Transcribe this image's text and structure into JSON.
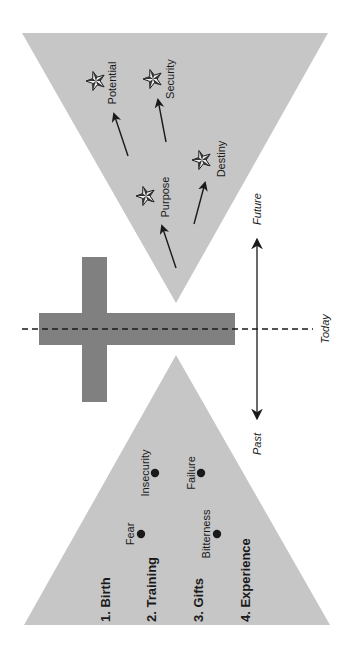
{
  "diagram": {
    "colors": {
      "triangle_fill": "#c6c6c6",
      "cross_fill": "#808080",
      "ink": "#1a1a1a",
      "background": "#ffffff"
    },
    "future_triangle": {
      "stars": [
        {
          "label": "Potential",
          "x": 96,
          "y": 81,
          "label_x": 112,
          "label_y": 83
        },
        {
          "label": "Security",
          "x": 153,
          "y": 79,
          "label_x": 170,
          "label_y": 79
        },
        {
          "label": "Destiny",
          "x": 202,
          "y": 160,
          "label_x": 221,
          "label_y": 159
        },
        {
          "label": "Purpose",
          "x": 146,
          "y": 196,
          "label_x": 165,
          "label_y": 197
        }
      ],
      "arrows": [
        {
          "from": [
            128,
            156
          ],
          "to": [
            114,
            114
          ]
        },
        {
          "from": [
            166,
            142
          ],
          "to": [
            158,
            100
          ]
        },
        {
          "from": [
            194,
            224
          ],
          "to": [
            205,
            183
          ]
        },
        {
          "from": [
            176,
            268
          ],
          "to": [
            162,
            226
          ]
        }
      ]
    },
    "past_triangle": {
      "stages": [
        {
          "label": "1. Birth",
          "x": 105
        },
        {
          "label": "2. Training",
          "x": 151
        },
        {
          "label": "3. Gifts",
          "x": 198
        },
        {
          "label": "4. Experience",
          "x": 245
        }
      ],
      "points": [
        {
          "label": "Insecurity",
          "dot_x": 155,
          "dot_y": 473,
          "label_x": 145,
          "label_y": 473
        },
        {
          "label": "Failure",
          "dot_x": 201,
          "dot_y": 473,
          "label_x": 191,
          "label_y": 473
        },
        {
          "label": "Fear",
          "dot_x": 141,
          "dot_y": 534,
          "label_x": 130,
          "label_y": 534
        },
        {
          "label": "Bitterness",
          "dot_x": 217,
          "dot_y": 534,
          "label_x": 206,
          "label_y": 534
        }
      ]
    },
    "timeline": {
      "future_label": "Future",
      "past_label": "Past",
      "today_label": "Today"
    }
  }
}
